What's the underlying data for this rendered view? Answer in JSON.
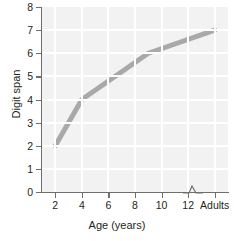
{
  "chart_data": {
    "type": "line",
    "title": "",
    "xlabel": "Age (years)",
    "ylabel": "Digit span",
    "x": [
      2,
      4,
      9,
      14
    ],
    "values": [
      2,
      4,
      6,
      7
    ],
    "x_tick_labels": [
      "2",
      "4",
      "6",
      "8",
      "10",
      "12",
      "Adults"
    ],
    "x_tick_values": [
      2,
      4,
      6,
      8,
      10,
      12,
      14
    ],
    "y_tick_labels": [
      "0",
      "1",
      "2",
      "3",
      "4",
      "5",
      "6",
      "7",
      "8"
    ],
    "y_tick_values": [
      0,
      1,
      2,
      3,
      4,
      5,
      6,
      7,
      8
    ],
    "xlim": [
      1,
      15
    ],
    "ylim": [
      0,
      8
    ],
    "grid": true,
    "legend": null,
    "axis_break": {
      "axis": "x",
      "between": [
        "12",
        "Adults"
      ],
      "symbol": "zigzag"
    },
    "series": [
      {
        "name": "Digit span",
        "color": "#a9a9a9",
        "points": [
          {
            "x": 2,
            "y": 2,
            "x_label": "2"
          },
          {
            "x": 4,
            "y": 4,
            "x_label": "4"
          },
          {
            "x": 9,
            "y": 6,
            "x_label": "9"
          },
          {
            "x": 14,
            "y": 7,
            "x_label": "Adults"
          }
        ]
      }
    ],
    "colors": {
      "line": "#a9a9a9",
      "plot_background": "#f2f2f2",
      "gridline": "#ffffff",
      "axis": "#6e6e6e",
      "text": "#231f20"
    }
  }
}
